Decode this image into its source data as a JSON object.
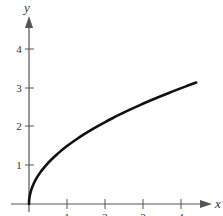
{
  "chart_data": {
    "type": "line",
    "title": "",
    "xlabel": "x",
    "ylabel": "y",
    "function": "y = 1.5*sqrt(x)",
    "x": [
      0,
      0.25,
      0.5,
      1,
      1.5,
      2,
      2.5,
      3,
      3.5,
      4,
      4.4
    ],
    "series": [
      {
        "name": "curve",
        "values": [
          0,
          0.75,
          1.06,
          1.5,
          1.84,
          2.12,
          2.37,
          2.6,
          2.81,
          3.0,
          3.15
        ]
      }
    ],
    "xlim": [
      0,
      4.5
    ],
    "ylim": [
      0,
      4.5
    ],
    "xticks": [
      "1",
      "2",
      "3",
      "4"
    ],
    "yticks": [
      "1",
      "2",
      "3",
      "4"
    ],
    "grid": false,
    "legend": "none"
  },
  "axes": {
    "x_label": "x",
    "y_label": "y",
    "x_tick_labels": [
      "1",
      "2",
      "3",
      "4"
    ],
    "y_tick_labels": [
      "1",
      "2",
      "3",
      "4"
    ]
  },
  "colors": {
    "axis": "#555555",
    "curve": "#111111"
  }
}
